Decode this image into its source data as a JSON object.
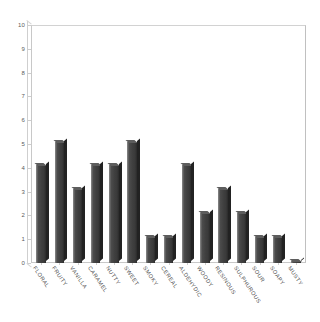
{
  "chart_data": {
    "type": "bar",
    "title": "",
    "subtitle": "",
    "xlabel": "",
    "ylabel": "",
    "ylim": [
      0,
      10
    ],
    "ytick_labels": [
      "10",
      "9",
      "8",
      "7",
      "6",
      "5",
      "4",
      "3",
      "2",
      "1",
      "0"
    ],
    "ytick_values": [
      10,
      9,
      8,
      7,
      6,
      5,
      4,
      3,
      2,
      1,
      0
    ],
    "grid": false,
    "legend": null,
    "legend_position": "none",
    "categories": [
      "FLORAL",
      "FRUITY",
      "VANILLA",
      "CARAMEL",
      "NUTTY",
      "SWEET",
      "SMOKY",
      "CEREAL",
      "ALDEHYDIC",
      "WOODY",
      "RESINOUS",
      "SULPHUROUS",
      "SOUR",
      "SOAPY",
      "MUSTY"
    ],
    "values": [
      4.1,
      5.1,
      3.1,
      4.1,
      4.1,
      5.1,
      1.1,
      1.1,
      4.1,
      2.1,
      3.1,
      2.1,
      1.1,
      1.1,
      0.1
    ],
    "bar_color": "#434343",
    "bar_edge_color": "#222222",
    "axis_color": "#c8c8c8",
    "tick_label_color": "#4a4a4a",
    "background_color": "#ffffff",
    "style": "3d-bar"
  }
}
